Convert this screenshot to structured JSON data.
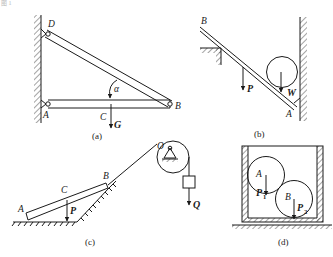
{
  "figure": {
    "corner_fragment": "图 1",
    "panels": [
      {
        "id": "a",
        "caption": "(a)",
        "labels": {
          "D": "D",
          "A": "A",
          "B": "B",
          "C": "C",
          "angle": "α"
        },
        "forces": [
          {
            "name": "G",
            "label": "G"
          }
        ]
      },
      {
        "id": "b",
        "caption": "(b)",
        "labels": {
          "B": "B",
          "A": "A"
        },
        "forces": [
          {
            "name": "P",
            "label": "P"
          },
          {
            "name": "W",
            "label": "W"
          }
        ]
      },
      {
        "id": "c",
        "caption": "(c)",
        "labels": {
          "A": "A",
          "B": "B",
          "C": "C",
          "O": "O"
        },
        "forces": [
          {
            "name": "P",
            "label": "P"
          },
          {
            "name": "Q",
            "label": "Q"
          }
        ]
      },
      {
        "id": "d",
        "caption": "(d)",
        "labels": {
          "A": "A",
          "B": "B"
        },
        "forces": [
          {
            "name": "P1",
            "label": "P",
            "subscript": "1"
          },
          {
            "name": "P2",
            "label": "P",
            "subscript": "2"
          }
        ]
      }
    ],
    "colors": {
      "line": "#1a1a1a",
      "background": "#ffffff"
    }
  }
}
